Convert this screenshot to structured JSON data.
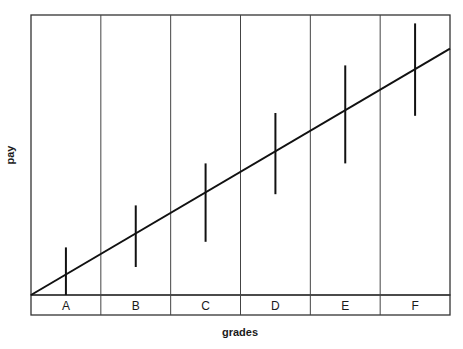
{
  "chart_data": {
    "type": "diagram",
    "title": "",
    "xlabel": "grades",
    "ylabel": "pay",
    "categories": [
      "A",
      "B",
      "C",
      "D",
      "E",
      "F"
    ],
    "pay_ranges": [
      {
        "grade": "A",
        "min": 0.0,
        "max": 0.17
      },
      {
        "grade": "B",
        "min": 0.1,
        "max": 0.32
      },
      {
        "grade": "C",
        "min": 0.19,
        "max": 0.47
      },
      {
        "grade": "D",
        "min": 0.36,
        "max": 0.65
      },
      {
        "grade": "E",
        "min": 0.47,
        "max": 0.82
      },
      {
        "grade": "F",
        "min": 0.64,
        "max": 0.97
      }
    ],
    "trend_line": {
      "start": 0.0,
      "end": 0.88
    },
    "ylim": [
      0,
      1
    ],
    "grid": "vertical dividers between grades",
    "legend": "none",
    "colors": {
      "line": "#111111",
      "frame": "#333333",
      "background": "#ffffff"
    }
  }
}
